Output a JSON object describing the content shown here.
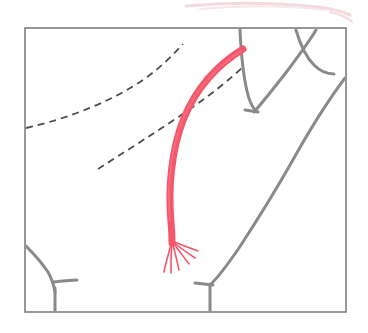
{
  "figure": {
    "title": "Anatomical line drawing of a vessel graft in a chest cavity",
    "caption": "",
    "canvas": {
      "width": 368,
      "height": 333,
      "background": "#ffffff"
    },
    "frame": {
      "name": "illustration-border",
      "x": 25,
      "y": 28,
      "width": 321,
      "height": 284,
      "stroke": "#7d7d7d",
      "stroke_width": 1.6,
      "fill": "#ffffff"
    },
    "colors": {
      "vessel_red": "#F4566A",
      "vessel_red_light": "#F47888",
      "anatomy_gray": "#8a8a8a",
      "dashed_gray": "#4d4d4d",
      "border_gray": "#7d7d7d",
      "bleed_pink": "#efc9d2"
    },
    "bleed_artifact": {
      "name": "top-edge-pink-smudge",
      "description": "faint pink curved line fragment bleeding in from the adjacent figure above",
      "color": "#e9bcc6"
    },
    "elements": [
      {
        "name": "vessel-graft-curve",
        "type": "red-curve",
        "description": "Thick coral-red arterial graft arching from upper right down and left, bowing outward",
        "color": "#F4566A",
        "stroke_width": 7,
        "start": [
          243,
          49
        ],
        "end": [
          172,
          243
        ],
        "path": "M 243 49 C 222 62, 198 84, 184 118 C 171 150, 168 190, 171 222 C 172 233, 172 239, 172 243"
      },
      {
        "name": "vessel-frayed-tip",
        "type": "strand-fan",
        "description": "Six fine splayed strands fanning out from the lower end of the red vessel",
        "color": "#F4566A",
        "stroke_width": 1.6,
        "origin": [
          172,
          241
        ],
        "strands": [
          "M 172 241 C 169 252, 166 262, 164 272",
          "M 172 241 C 171 253, 171 263, 171 273",
          "M 172 241 C 175 252, 177 261, 179 270",
          "M 172 241 C 178 250, 184 257, 189 264",
          "M 172 241 C 180 248, 188 253, 195 258",
          "M 172 241 C 181 245, 190 248, 198 251"
        ]
      },
      {
        "name": "dashed-guide-line-upper",
        "type": "dashed-line",
        "description": "Upper dashed reference line sweeping from left border up to the top right",
        "color": "#4d4d4d",
        "stroke_width": 1.8,
        "dash": "7 5",
        "path": "M 26 128 C 70 118, 112 101, 143 80 C 160 68, 172 56, 183 44"
      },
      {
        "name": "dashed-guide-line-lower",
        "type": "dashed-line",
        "description": "Lower dashed reference line running from lower left up to the vessel origin",
        "color": "#4d4d4d",
        "stroke_width": 1.8,
        "dash": "7 5",
        "path": "M 98 169 C 126 151, 158 131, 190 109 C 212 94, 230 79, 244 66"
      },
      {
        "name": "anatomy-line-vertical-notch",
        "type": "gray-line",
        "description": "Gray vertical line from top border descending to a V-shaped notch",
        "color": "#8a8a8a",
        "stroke_width": 3,
        "path": "M 240 30 C 241 52, 243 74, 247 91 C 249 100, 252 107, 256 111"
      },
      {
        "name": "anatomy-line-notch-right",
        "type": "gray-line",
        "description": "Gray line forming the right side of the V notch, rising to the upper right",
        "color": "#8a8a8a",
        "stroke_width": 3,
        "path": "M 254 112 C 262 103, 274 88, 288 70 C 299 55, 309 42, 316 30"
      },
      {
        "name": "anatomy-line-notch-base",
        "type": "gray-line",
        "description": "Short gray tick closing the base of the V notch",
        "color": "#8a8a8a",
        "stroke_width": 3,
        "path": "M 245 110 L 258 112"
      },
      {
        "name": "anatomy-line-upper-right-hook",
        "type": "gray-line",
        "description": "Gray hooked curve in the upper right corner sweeping down and right",
        "color": "#8a8a8a",
        "stroke_width": 3,
        "path": "M 296 30 C 300 44, 306 57, 314 65 C 320 71, 327 74, 334 74"
      },
      {
        "name": "anatomy-line-right-sweep",
        "type": "gray-line",
        "description": "Long gray curve sweeping from the right border down and left toward the bottom",
        "color": "#8a8a8a",
        "stroke_width": 3,
        "path": "M 345 78 C 330 98, 312 126, 294 158 C 276 190, 256 222, 239 248 C 228 264, 219 276, 212 283"
      },
      {
        "name": "anatomy-line-bottom-right-stub",
        "type": "gray-line",
        "description": "Short gray vertical stub descending from the sweep to the bottom border",
        "color": "#8a8a8a",
        "stroke_width": 3,
        "path": "M 210 284 C 210 295, 210 304, 210 311"
      },
      {
        "name": "anatomy-line-bottom-right-tick",
        "type": "gray-line",
        "description": "Short gray tick angling left from the bottom stub",
        "color": "#8a8a8a",
        "stroke_width": 3,
        "path": "M 195 283 L 213 285"
      },
      {
        "name": "anatomy-line-bottom-left-branch",
        "type": "gray-line",
        "description": "Gray diagonal branch descending from the left border toward the bottom",
        "color": "#8a8a8a",
        "stroke_width": 3,
        "path": "M 26 246 C 34 254, 42 263, 48 272 C 52 279, 54 286, 55 292"
      },
      {
        "name": "anatomy-line-bottom-left-stem",
        "type": "gray-line",
        "description": "Short gray vertical stem running from the branch down to the bottom border",
        "color": "#8a8a8a",
        "stroke_width": 3,
        "path": "M 55 288 C 55 296, 55 304, 55 311"
      },
      {
        "name": "anatomy-line-bottom-left-tick",
        "type": "gray-line",
        "description": "Short gray tick angling right from the bottom-left branch joint",
        "color": "#8a8a8a",
        "stroke_width": 3,
        "path": "M 53 282 C 62 281, 70 280, 77 280"
      }
    ]
  }
}
